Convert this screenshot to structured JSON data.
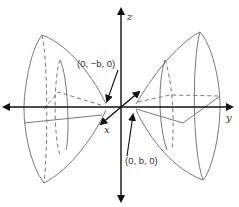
{
  "figure": {
    "type": "hyperboloid of two sheets",
    "axes": {
      "x_label": "x",
      "y_label": "y",
      "z_label": "z"
    },
    "points": [
      {
        "label": "(0, −b, 0)",
        "role": "left vertex"
      },
      {
        "label": "(0, b, 0)",
        "role": "right vertex"
      }
    ],
    "colors": {
      "surface_stroke": "#777777",
      "axis": "#111111",
      "text": "#333333",
      "background": "#ffffff"
    }
  }
}
